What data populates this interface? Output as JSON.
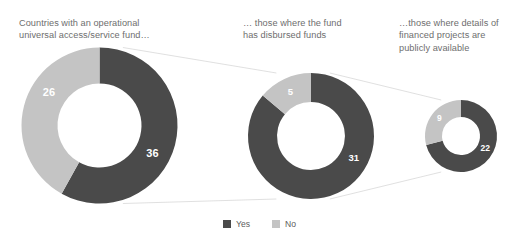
{
  "colors": {
    "yes": "#4a4a4a",
    "no": "#c4c4c4",
    "title_text": "#6e6e6e",
    "legend_text": "#5d5d5d",
    "value_text": "#ffffff",
    "connector": "#d8d8d8",
    "background": "#ffffff"
  },
  "panels": [
    {
      "title": "Countries with an operational\nuniversal access/service fund…",
      "yes_value": "36",
      "no_value": "26"
    },
    {
      "title": "… those where the fund\nhas disbursed funds",
      "yes_value": "31",
      "no_value": "5"
    },
    {
      "title": "…those where details of\nfinanced projects are\npublicly available",
      "yes_value": "22",
      "no_value": "9"
    }
  ],
  "legend": {
    "items": [
      {
        "label": "Yes",
        "color": "#4a4a4a"
      },
      {
        "label": "No",
        "color": "#c4c4c4"
      }
    ]
  },
  "chart_data": {
    "type": "pie",
    "title": "",
    "subtitle": "",
    "xlabel": "",
    "ylabel": "",
    "grid": false,
    "legend_position": "bottom-center",
    "charts": [
      {
        "name": "Countries with an operational universal access/service fund…",
        "labels": [
          "Yes",
          "No"
        ],
        "values": [
          36,
          26
        ],
        "total": 62,
        "donut": true,
        "start_angle_deg": 0,
        "direction": "clockwise",
        "center_px": [
          99.5,
          125.5
        ],
        "outer_radius_px": 78,
        "inner_radius_px": 42
      },
      {
        "name": "… those where the fund has disbursed funds",
        "labels": [
          "Yes",
          "No"
        ],
        "values": [
          31,
          5
        ],
        "total": 36,
        "donut": true,
        "start_angle_deg": 0,
        "direction": "clockwise",
        "center_px": [
          311,
          136
        ],
        "outer_radius_px": 63,
        "inner_radius_px": 34
      },
      {
        "name": "…those where details of financed projects are publicly available",
        "labels": [
          "Yes",
          "No"
        ],
        "values": [
          22,
          9
        ],
        "total": 31,
        "donut": true,
        "start_angle_deg": 0,
        "direction": "clockwise",
        "center_px": [
          461,
          136
        ],
        "outer_radius_px": 36,
        "inner_radius_px": 19
      }
    ],
    "series": [
      {
        "name": "Yes",
        "values": [
          36,
          31,
          22
        ]
      },
      {
        "name": "No",
        "values": [
          26,
          5,
          9
        ]
      }
    ],
    "categories": [
      "Countries with an operational universal access/service fund…",
      "… those where the fund has disbursed funds",
      "…those where details of financed projects are publicly available"
    ]
  }
}
